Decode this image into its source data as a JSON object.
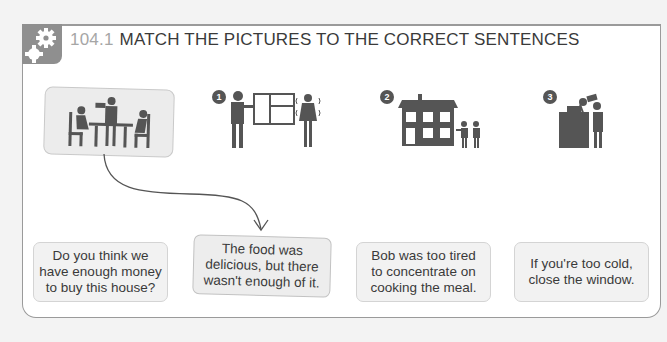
{
  "exercise": {
    "number": "104.1",
    "title": "MATCH THE PICTURES TO THE CORRECT SENTENCES",
    "icon": "gears-icon"
  },
  "pictures": [
    {
      "label": "",
      "description": "Waiter serving two people seated at a table",
      "icon": "restaurant-icon",
      "selected": true
    },
    {
      "label": "1",
      "description": "Man opening a window while woman shivers",
      "icon": "window-cold-icon"
    },
    {
      "label": "2",
      "description": "Two people pointing at a large house",
      "icon": "house-icon"
    },
    {
      "label": "3",
      "description": "Chef cooking at a stove",
      "icon": "chef-icon"
    }
  ],
  "sentences": [
    {
      "text": "Do you think we\nhave enough money\nto buy this house?"
    },
    {
      "text": "The food was\ndelicious, but there\nwasn't enough of it.",
      "matched": true
    },
    {
      "text": "Bob was too tired\nto concentrate on\ncooking the meal."
    },
    {
      "text": "If you're too cold,\nclose the window."
    }
  ],
  "colors": {
    "icon_bg": "#8f8f8f",
    "number": "#a6a6a6",
    "text": "#3a3a3a",
    "card_bg": "#f2f2f2"
  }
}
